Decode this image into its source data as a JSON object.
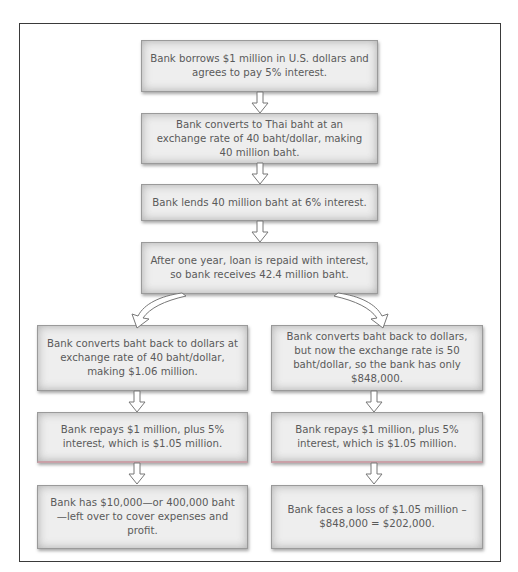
{
  "diagram": {
    "type": "flowchart",
    "main_flow": [
      {
        "id": "borrow",
        "text": "Bank borrows $1 million in U.S. dollars and agrees to pay 5% interest."
      },
      {
        "id": "convert",
        "text": "Bank converts to Thai baht at an exchange rate of 40 baht/dollar, making 40 million baht."
      },
      {
        "id": "lend",
        "text": "Bank lends 40 million baht at 6% interest."
      },
      {
        "id": "repaid",
        "text": "After one year, loan is repaid with interest, so bank receives 42.4 million baht."
      }
    ],
    "left_branch": [
      {
        "id": "convert-back-40",
        "text": "Bank converts baht back to dollars at exchange rate of 40 baht/dollar, making $1.06 million."
      },
      {
        "id": "repay-left",
        "text": "Bank repays $1 million, plus 5% interest, which is $1.05 million."
      },
      {
        "id": "profit",
        "text": "Bank has $10,000—or 400,000 baht—left over to cover expenses and profit."
      }
    ],
    "right_branch": [
      {
        "id": "convert-back-50",
        "text": "Bank converts baht back to dollars, but now the exchange rate is 50 baht/dollar, so the bank has only $848,000."
      },
      {
        "id": "repay-right",
        "text": "Bank repays $1 million, plus 5% interest, which is $1.05 million."
      },
      {
        "id": "loss",
        "text": "Bank faces a loss of $1.05 million – $848,000 = $202,000."
      }
    ],
    "colors": {
      "box_fill": "#eeeeee",
      "box_border": "#9a9a9a",
      "text": "#5a5a5a",
      "frame": "#3a3a3a"
    }
  }
}
